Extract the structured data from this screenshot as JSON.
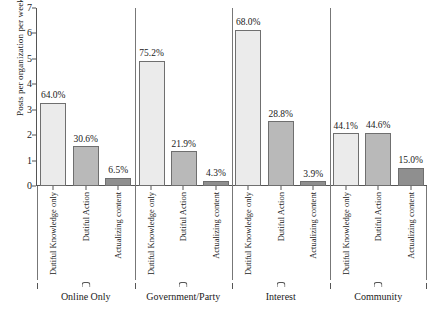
{
  "chart_data": {
    "type": "bar",
    "title": "",
    "subtitle": "",
    "xlabel": "",
    "ylabel": "Posts per organization per week",
    "ylim": [
      0,
      7
    ],
    "yticks": [
      0,
      1,
      2,
      3,
      4,
      5,
      6,
      7
    ],
    "grid": false,
    "legend": "none",
    "value_label_suffix": "%",
    "categories": [
      "Dutiful Knowledge only",
      "Dutiful Action",
      "Actualizing content"
    ],
    "panels": [
      {
        "name": "Online Only",
        "bars": [
          {
            "category": "Dutiful Knowledge only",
            "value": 3.27,
            "label": "64.0%",
            "shade": "light"
          },
          {
            "category": "Dutiful Action",
            "value": 1.57,
            "label": "30.6%",
            "shade": "mid"
          },
          {
            "category": "Actualizing content",
            "value": 0.33,
            "label": "6.5%",
            "shade": "dark"
          }
        ]
      },
      {
        "name": "Government/Party",
        "bars": [
          {
            "category": "Dutiful Knowledge only",
            "value": 4.92,
            "label": "75.2%",
            "shade": "light"
          },
          {
            "category": "Dutiful Action",
            "value": 1.37,
            "label": "21.9%",
            "shade": "mid"
          },
          {
            "category": "Actualizing content",
            "value": 0.21,
            "label": "4.3%",
            "shade": "dark"
          }
        ]
      },
      {
        "name": "Interest",
        "bars": [
          {
            "category": "Dutiful Knowledge only",
            "value": 6.14,
            "label": "68.0%",
            "shade": "light"
          },
          {
            "category": "Dutiful Action",
            "value": 2.55,
            "label": "28.8%",
            "shade": "mid"
          },
          {
            "category": "Actualizing content",
            "value": 0.19,
            "label": "3.9%",
            "shade": "dark"
          }
        ]
      },
      {
        "name": "Community",
        "bars": [
          {
            "category": "Dutiful Knowledge only",
            "value": 2.08,
            "label": "44.1%",
            "shade": "light"
          },
          {
            "category": "Dutiful Action",
            "value": 2.1,
            "label": "44.6%",
            "shade": "mid"
          },
          {
            "category": "Actualizing content",
            "value": 0.71,
            "label": "15.0%",
            "shade": "dark"
          }
        ]
      }
    ],
    "colors": {
      "light": "#ebebeb",
      "mid": "#b9b9b9",
      "dark": "#8f8f8f",
      "bar_border": "#6f6f6f",
      "axis": "#555555",
      "background": "#ffffff",
      "text": "#1a1a1a"
    }
  }
}
